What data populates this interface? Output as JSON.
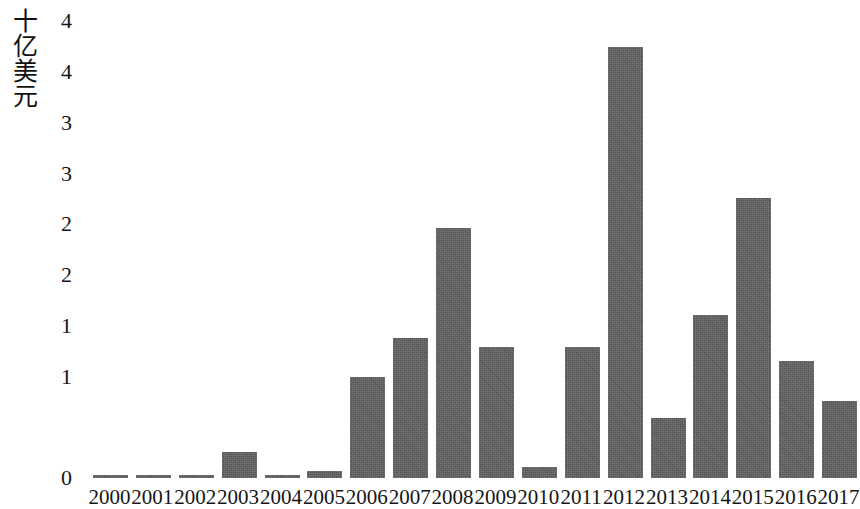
{
  "chart_data": {
    "type": "bar",
    "title": "",
    "subtitle": "",
    "xlabel": "",
    "ylabel": "十亿美元",
    "categories": [
      "2000",
      "2001",
      "2002",
      "2003",
      "2004",
      "2005",
      "2006",
      "2007",
      "2008",
      "2009",
      "2010",
      "2011",
      "2012",
      "2013",
      "2014",
      "2015",
      "2016",
      "2017"
    ],
    "values": [
      0.03,
      0.02,
      0.02,
      0.26,
      0.03,
      0.07,
      1.0,
      1.38,
      2.46,
      1.29,
      0.11,
      1.29,
      4.25,
      0.59,
      1.61,
      2.76,
      1.15,
      0.76
    ],
    "series": [
      {
        "name": "十亿美元",
        "values": [
          0.03,
          0.02,
          0.02,
          0.26,
          0.03,
          0.07,
          1.0,
          1.38,
          2.46,
          1.29,
          0.11,
          1.29,
          4.25,
          0.59,
          1.61,
          2.76,
          1.15,
          0.76
        ]
      }
    ],
    "ylim": [
      0,
      4.5
    ],
    "ytick_values": [
      4.5,
      4.0,
      3.5,
      3.0,
      2.5,
      2.0,
      1.5,
      1.0,
      0.5,
      0
    ],
    "ytick_labels": [
      "4",
      "4",
      "3",
      "3",
      "2",
      "2",
      "1",
      "1",
      "0"
    ],
    "grid": false,
    "legend": null,
    "legend_position": "none",
    "bar_color": "#5e5e5e",
    "background_color": "#ffffff",
    "annotations": []
  },
  "axes": {
    "y_title": "十亿美元",
    "y_ticks": [
      {
        "label": "4",
        "value": 4.5
      },
      {
        "label": "4",
        "value": 4.0
      },
      {
        "label": "3",
        "value": 3.5
      },
      {
        "label": "3",
        "value": 3.0
      },
      {
        "label": "2",
        "value": 2.5
      },
      {
        "label": "2",
        "value": 2.0
      },
      {
        "label": "1",
        "value": 1.5
      },
      {
        "label": "1",
        "value": 1.0
      },
      {
        "label": "0",
        "value": 0
      }
    ],
    "x_ticks": [
      "2000",
      "2001",
      "2002",
      "2003",
      "2004",
      "2005",
      "2006",
      "2007",
      "2008",
      "2009",
      "2010",
      "2011",
      "2012",
      "2013",
      "2014",
      "2015",
      "2016",
      "2017"
    ]
  }
}
